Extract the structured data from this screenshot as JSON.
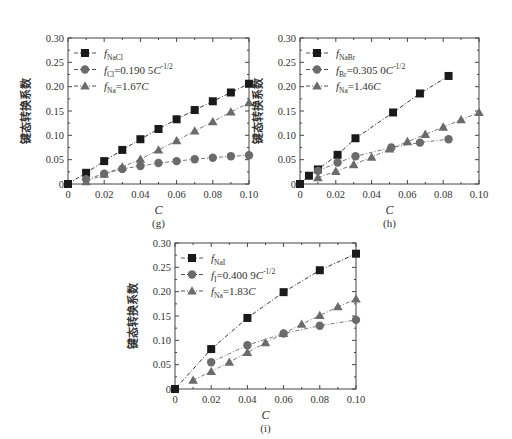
{
  "chart_data": [
    {
      "id": "g",
      "type": "scatter",
      "panel_label": "(g)",
      "xlabel": "C",
      "ylabel": "键态转换系数",
      "xlim": [
        0,
        0.1
      ],
      "ylim": [
        0,
        0.3
      ],
      "xticks": [
        "0",
        "0.02",
        "0.04",
        "0.06",
        "0.08",
        "0.10"
      ],
      "yticks": [
        "0",
        "0.05",
        "0.10",
        "0.15",
        "0.20",
        "0.25",
        "0.30"
      ],
      "grid": false,
      "legend_position": "upper-left",
      "series": [
        {
          "name": "f_NaCl",
          "legend_main": "f",
          "legend_sub": "NaCl",
          "legend_rest": "",
          "marker": "square",
          "color": "#1a1a1a",
          "x": [
            0,
            0.01,
            0.02,
            0.03,
            0.04,
            0.05,
            0.06,
            0.07,
            0.08,
            0.09,
            0.1
          ],
          "y": [
            0,
            0.023,
            0.047,
            0.07,
            0.092,
            0.113,
            0.133,
            0.152,
            0.17,
            0.188,
            0.206
          ]
        },
        {
          "name": "f_Cl=0.190 5C^-1/2",
          "legend_main": "f",
          "legend_sub": "Cl",
          "legend_rest": "=0.190 5C",
          "legend_sup": "-1/2",
          "marker": "circle",
          "color": "#6b6b6b",
          "x": [
            0.01,
            0.02,
            0.03,
            0.04,
            0.05,
            0.06,
            0.07,
            0.08,
            0.09,
            0.1
          ],
          "y": [
            0.01,
            0.021,
            0.031,
            0.037,
            0.043,
            0.047,
            0.051,
            0.054,
            0.057,
            0.059
          ]
        },
        {
          "name": "f_Na=1.67C",
          "legend_main": "f",
          "legend_sub": "Na",
          "legend_rest": "=1.67C",
          "marker": "triangle",
          "color": "#6b6b6b",
          "x": [
            0.01,
            0.02,
            0.03,
            0.04,
            0.05,
            0.06,
            0.07,
            0.08,
            0.09,
            0.1
          ],
          "y": [
            0.005,
            0.02,
            0.035,
            0.051,
            0.07,
            0.089,
            0.109,
            0.128,
            0.148,
            0.167
          ]
        }
      ]
    },
    {
      "id": "h",
      "type": "scatter",
      "panel_label": "(h)",
      "xlabel": "C",
      "ylabel": "键态转换系数",
      "xlim": [
        0,
        0.1
      ],
      "ylim": [
        0,
        0.3
      ],
      "xticks": [
        "0",
        "0.02",
        "0.04",
        "0.06",
        "0.08",
        "0.10"
      ],
      "yticks": [
        "0",
        "0.05",
        "0.10",
        "0.15",
        "0.20",
        "0.25",
        "0.30"
      ],
      "grid": false,
      "legend_position": "upper-left",
      "series": [
        {
          "name": "f_NaBr",
          "legend_main": "f",
          "legend_sub": "NaBr",
          "legend_rest": "",
          "marker": "square",
          "color": "#1a1a1a",
          "x": [
            0,
            0.005,
            0.01,
            0.021,
            0.031,
            0.052,
            0.067,
            0.083
          ],
          "y": [
            0,
            0.017,
            0.03,
            0.06,
            0.094,
            0.147,
            0.186,
            0.222
          ]
        },
        {
          "name": "f_Br=0.305 0C^-1/2",
          "legend_main": "f",
          "legend_sub": "Br",
          "legend_rest": "=0.305 0C",
          "legend_sup": "-1/2",
          "marker": "circle",
          "color": "#6b6b6b",
          "x": [
            0.01,
            0.021,
            0.031,
            0.051,
            0.067,
            0.083
          ],
          "y": [
            0.027,
            0.044,
            0.057,
            0.075,
            0.085,
            0.092
          ]
        },
        {
          "name": "f_Na=1.46C",
          "legend_main": "f",
          "legend_sub": "Na",
          "legend_rest": "=1.46C",
          "marker": "triangle",
          "color": "#6b6b6b",
          "x": [
            0.01,
            0.02,
            0.03,
            0.04,
            0.05,
            0.06,
            0.07,
            0.08,
            0.09,
            0.1
          ],
          "y": [
            0.013,
            0.026,
            0.04,
            0.055,
            0.072,
            0.087,
            0.102,
            0.117,
            0.132,
            0.147
          ]
        }
      ]
    },
    {
      "id": "i",
      "type": "scatter",
      "panel_label": "(i)",
      "xlabel": "C",
      "ylabel": "键态转换系数",
      "xlim": [
        0,
        0.1
      ],
      "ylim": [
        0,
        0.3
      ],
      "xticks": [
        "0",
        "0.02",
        "0.04",
        "0.06",
        "0.08",
        "0.10"
      ],
      "yticks": [
        "0",
        "0.05",
        "0.10",
        "0.15",
        "0.20",
        "0.25",
        "0.30"
      ],
      "grid": false,
      "legend_position": "upper-left",
      "series": [
        {
          "name": "f_NaI",
          "legend_main": "f",
          "legend_sub": "NaI",
          "legend_rest": "",
          "marker": "square",
          "color": "#1a1a1a",
          "x": [
            0,
            0.02,
            0.04,
            0.06,
            0.08,
            0.1
          ],
          "y": [
            0,
            0.082,
            0.146,
            0.199,
            0.244,
            0.278
          ]
        },
        {
          "name": "f_I=0.400 9C^-1/2",
          "legend_main": "f",
          "legend_sub": "I",
          "legend_rest": "=0.400 9C",
          "legend_sup": "-1/2",
          "marker": "circle",
          "color": "#6b6b6b",
          "x": [
            0.02,
            0.04,
            0.06,
            0.08,
            0.1
          ],
          "y": [
            0.055,
            0.09,
            0.114,
            0.13,
            0.142
          ]
        },
        {
          "name": "f_Na=1.83C",
          "legend_main": "f",
          "legend_sub": "Na",
          "legend_rest": "=1.83C",
          "marker": "triangle",
          "color": "#6b6b6b",
          "x": [
            0.01,
            0.02,
            0.03,
            0.04,
            0.05,
            0.06,
            0.07,
            0.08,
            0.09,
            0.1
          ],
          "y": [
            0.018,
            0.036,
            0.055,
            0.075,
            0.095,
            0.114,
            0.133,
            0.151,
            0.169,
            0.185
          ]
        }
      ]
    }
  ],
  "layout": {
    "g": {
      "left": 68,
      "top": 38,
      "right": 249,
      "bottom": 184
    },
    "h": {
      "left": 300,
      "top": 38,
      "right": 479,
      "bottom": 184
    },
    "i": {
      "left": 175,
      "top": 243,
      "right": 356,
      "bottom": 389
    }
  }
}
